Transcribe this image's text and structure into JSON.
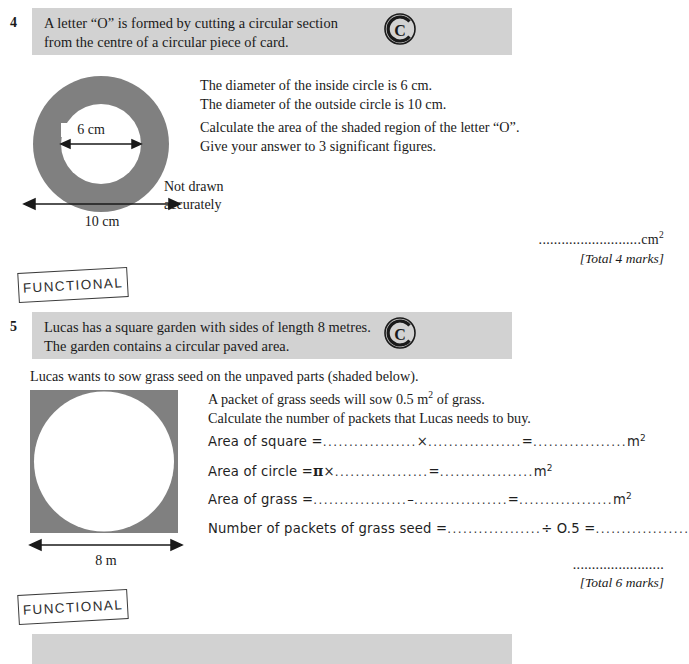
{
  "page": {
    "background": "#ffffff",
    "bar_color": "#d2d2d2",
    "shape_fill": "#808080"
  },
  "question4": {
    "number": "4",
    "prompt": "A letter “O” is formed by cutting a circular section\nfrom the centre of a circular piece of card.",
    "calculator_icon": "calculator-allowed-c-icon",
    "details": "The diameter of the inside circle is 6 cm.\nThe diameter of the outside circle is 10 cm.",
    "instruction": "Calculate the area of the shaded region of the letter “O”.\nGive your answer to 3 significant figures.",
    "diagram": {
      "name": "annulus-diagram",
      "inner_label": "6 cm",
      "outer_label": "10 cm",
      "not_drawn_note": "Not drawn\naccurately"
    },
    "answer_dots": "...........................",
    "answer_unit": "cm",
    "answer_unit_sup": "2",
    "total_marks": "[Total 4 marks]"
  },
  "functional_stamp_top": {
    "label": "FUNCTIONAL"
  },
  "question5": {
    "number": "5",
    "prompt": "Lucas has a square garden with sides of length 8 metres.\nThe garden contains a circular paved area.",
    "calculator_icon": "calculator-allowed-c-icon",
    "lead_in": "Lucas wants to sow grass seed on the unpaved parts (shaded below).",
    "details": "A packet of grass seeds will sow 0.5 m² of grass.\nCalculate the number of packets that Lucas needs to buy.",
    "details_line1_pre": "A packet of grass seeds will sow 0.5 m",
    "details_line1_sup": "2",
    "details_line1_post": " of grass.",
    "details_line2": "Calculate the number of packets that Lucas needs to buy.",
    "diagram": {
      "name": "square-with-inscribed-circle-diagram",
      "side_label": "8 m"
    },
    "working": [
      {
        "name": "area-of-square-line",
        "label": "Area of square =",
        "segments": [
          "blank",
          "×",
          "blank",
          "=",
          "blank"
        ],
        "unit": "m",
        "unit_sup": "2"
      },
      {
        "name": "area-of-circle-line",
        "label": "Area of circle =",
        "pi": "π",
        "segments": [
          "×",
          "blank",
          "=",
          "blank"
        ],
        "unit": "m",
        "unit_sup": "2"
      },
      {
        "name": "area-of-grass-line",
        "label": "Area of grass =",
        "segments": [
          "blank",
          "–",
          "blank",
          "=",
          "blank"
        ],
        "unit": "m",
        "unit_sup": "2"
      },
      {
        "name": "number-of-packets-line",
        "label": "Number of packets of grass seed =",
        "segments": [
          "blank",
          "÷ O.5 =",
          "blank"
        ],
        "unit": "",
        "unit_sup": ""
      }
    ],
    "blank_dots": "..................",
    "answer_dots": "........................",
    "total_marks": "[Total 6 marks]"
  },
  "functional_stamp_bottom": {
    "label": "FUNCTIONAL"
  },
  "next_question_bar": {
    "name": "next-question-header-bar",
    "text": ""
  }
}
